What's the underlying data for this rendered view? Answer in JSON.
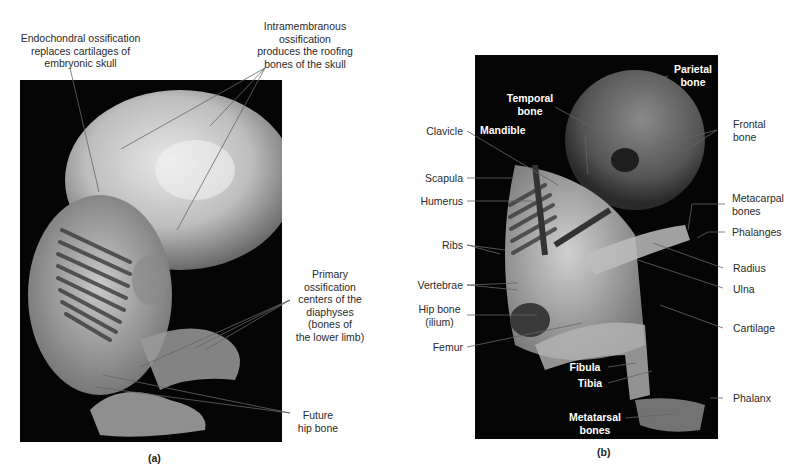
{
  "figure": {
    "panel_a": {
      "caption": "(a)",
      "labels": {
        "endochondral_l1": "Endochondral ossification",
        "endochondral_l2": "replaces cartilages of",
        "endochondral_l3": "embryonic skull",
        "intramembranous_l1": "Intramembranous",
        "intramembranous_l2": "ossification",
        "intramembranous_l3": "produces the roofing",
        "intramembranous_l4": "bones of the skull",
        "primary_l1": "Primary",
        "primary_l2": "ossification",
        "primary_l3": "centers of the",
        "primary_l4": "diaphyses",
        "primary_l5": "(bones of",
        "primary_l6": "the lower limb)",
        "future_hip_l1": "Future",
        "future_hip_l2": "hip bone"
      }
    },
    "panel_b": {
      "caption": "(b)",
      "labels": {
        "parietal_l1": "Parietal",
        "parietal_l2": "bone",
        "temporal_l1": "Temporal",
        "temporal_l2": "bone",
        "mandible": "Mandible",
        "clavicle": "Clavicle",
        "frontal_l1": "Frontal",
        "frontal_l2": "bone",
        "scapula": "Scapula",
        "humerus": "Humerus",
        "metacarpal_l1": "Metacarpal",
        "metacarpal_l2": "bones",
        "phalanges": "Phalanges",
        "ribs": "Ribs",
        "radius": "Radius",
        "ulna": "Ulna",
        "vertebrae": "Vertebrae",
        "hip_bone_l1": "Hip bone",
        "hip_bone_l2": "(ilium)",
        "cartilage": "Cartilage",
        "femur": "Femur",
        "fibula": "Fibula",
        "tibia": "Tibia",
        "phalanx": "Phalanx",
        "metatarsal_l1": "Metatarsal",
        "metatarsal_l2": "bones"
      }
    },
    "colors": {
      "photo_background": "#050505",
      "label_text": "#2a2a2a",
      "inner_label_text": "#ffffff",
      "leader_line": "#888888"
    }
  }
}
